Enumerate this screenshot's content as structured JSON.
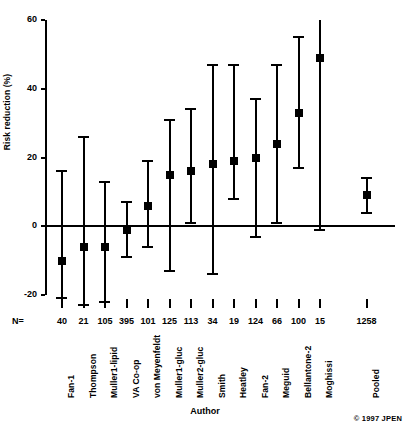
{
  "chart_data": {
    "type": "scatter",
    "title": "",
    "xlabel": "Author",
    "ylabel": "Risk reduction (%)",
    "ylim": [
      -20,
      60
    ],
    "yticks": [
      -20,
      0,
      20,
      40,
      60
    ],
    "ytick_labels": [
      "-20",
      "0",
      "20",
      "40",
      "60"
    ],
    "grid": false,
    "legend": false,
    "reference_line": 0,
    "n_row_prefix": "N=",
    "categories": [
      "Fan-1",
      "Thompson",
      "Muller1-lipid",
      "VA Co-op",
      "von Meyenfeldt",
      "Muller1-gluc",
      "Muller2-gluc",
      "Smith",
      "Heatley",
      "Fan-2",
      "Meguid",
      "Bellantone-2",
      "Moghissi",
      "Pooled"
    ],
    "n_values": [
      40,
      21,
      105,
      395,
      101,
      125,
      113,
      34,
      19,
      124,
      66,
      100,
      15,
      1258
    ],
    "points": [
      {
        "author": "Fan-1",
        "n": 40,
        "value": -10,
        "low": -21,
        "high": 16
      },
      {
        "author": "Thompson",
        "n": 21,
        "value": -6,
        "low": -23,
        "high": 26
      },
      {
        "author": "Muller1-lipid",
        "n": 105,
        "value": -6,
        "low": -22,
        "high": 13
      },
      {
        "author": "VA Co-op",
        "n": 395,
        "value": -1,
        "low": -9,
        "high": 7
      },
      {
        "author": "von Meyenfeldt",
        "n": 101,
        "value": 6,
        "low": -6,
        "high": 19
      },
      {
        "author": "Muller1-gluc",
        "n": 125,
        "value": 15,
        "low": -13,
        "high": 31
      },
      {
        "author": "Muller2-gluc",
        "n": 113,
        "value": 16,
        "low": 1,
        "high": 34
      },
      {
        "author": "Smith",
        "n": 34,
        "value": 18,
        "low": -14,
        "high": 47
      },
      {
        "author": "Heatley",
        "n": 19,
        "value": 19,
        "low": 8,
        "high": 47
      },
      {
        "author": "Fan-2",
        "n": 124,
        "value": 20,
        "low": -3,
        "high": 37
      },
      {
        "author": "Meguid",
        "n": 66,
        "value": 24,
        "low": 1,
        "high": 47
      },
      {
        "author": "Bellantone-2",
        "n": 100,
        "value": 33,
        "low": 17,
        "high": 55
      },
      {
        "author": "Moghissi",
        "n": 15,
        "value": 49,
        "low": -1,
        "high": 62
      },
      {
        "author": "Pooled",
        "n": 1258,
        "value": 9,
        "low": 4,
        "high": 14
      }
    ]
  },
  "footer": {
    "copyright": "© 1997 JPEN"
  }
}
